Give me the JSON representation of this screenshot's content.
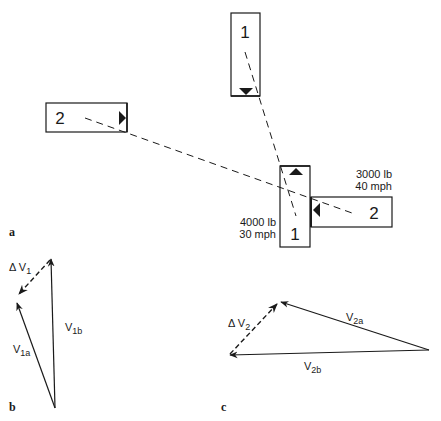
{
  "figure": {
    "panels": [
      {
        "id": "a",
        "label": "a",
        "description": "Collision configuration: vehicle 1 (4000 lb, 30 mph) and vehicle 2 (3000 lb, 40 mph), pre-impact and impact positions"
      },
      {
        "id": "b",
        "label": "b",
        "description": "Velocity vector triangle for vehicle 1"
      },
      {
        "id": "c",
        "label": "c",
        "description": "Velocity vector triangle for vehicle 2"
      }
    ],
    "vehicles": {
      "v1_pre": {
        "number": "1"
      },
      "v2_pre": {
        "number": "2"
      },
      "v1_impact": {
        "number": "1",
        "weight": "4000  lb",
        "speed": "30  mph"
      },
      "v2_impact": {
        "number": "2",
        "weight": "3000  lb",
        "speed": "40  mph"
      }
    },
    "vectors_b": {
      "delta": {
        "label": "Δ V",
        "sub": "1"
      },
      "post": {
        "label": "V",
        "sub": "1b"
      },
      "pre": {
        "label": "V",
        "sub": "1a"
      }
    },
    "vectors_c": {
      "delta": {
        "label": "Δ V",
        "sub": "2"
      },
      "pre": {
        "label": "V",
        "sub": "2a"
      },
      "post": {
        "label": "V",
        "sub": "2b"
      }
    },
    "colors": {
      "ink": "#1a1a1a",
      "background": "#ffffff"
    }
  }
}
